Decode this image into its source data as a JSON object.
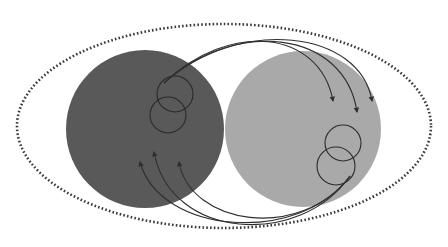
{
  "diagram": {
    "width": 448,
    "height": 247,
    "colors": {
      "background": "#ffffff",
      "boundary": "#3a3a3a",
      "left_region": "#595959",
      "right_region": "#a9a9a9",
      "lines": "#2f2f2f",
      "small_circles": "#2a2a2a"
    },
    "boundary_ellipse": {
      "cx": 224,
      "cy": 126,
      "rx": 207,
      "ry": 102,
      "style": "dotted"
    },
    "regions": [
      {
        "id": "left",
        "cx": 145,
        "cy": 129,
        "r": 79,
        "shade": "dark"
      },
      {
        "id": "right",
        "cx": 303,
        "cy": 129,
        "r": 78,
        "shade": "light"
      }
    ],
    "small_circles": [
      {
        "region": "left",
        "cx": 175,
        "cy": 94,
        "r": 18
      },
      {
        "region": "left",
        "cx": 168,
        "cy": 115,
        "r": 18
      },
      {
        "region": "right",
        "cx": 343,
        "cy": 143,
        "r": 18
      },
      {
        "region": "right",
        "cx": 336,
        "cy": 166,
        "r": 19
      }
    ],
    "arrows_top": [
      {
        "from": [
          164,
          83
        ],
        "c1": [
          230,
          20
        ],
        "c2": [
          320,
          30
        ],
        "to": [
          333,
          101
        ]
      },
      {
        "from": [
          164,
          83
        ],
        "c1": [
          235,
          18
        ],
        "c2": [
          345,
          30
        ],
        "to": [
          357,
          112
        ]
      },
      {
        "from": [
          164,
          83
        ],
        "c1": [
          240,
          16
        ],
        "c2": [
          360,
          30
        ],
        "to": [
          372,
          101
        ]
      }
    ],
    "arrows_bottom": [
      {
        "from": [
          350,
          176
        ],
        "c1": [
          300,
          245
        ],
        "c2": [
          160,
          235
        ],
        "to": [
          140,
          162
        ]
      },
      {
        "from": [
          350,
          176
        ],
        "c1": [
          300,
          248
        ],
        "c2": [
          170,
          240
        ],
        "to": [
          154,
          152
        ]
      },
      {
        "from": [
          350,
          176
        ],
        "c1": [
          300,
          242
        ],
        "c2": [
          190,
          225
        ],
        "to": [
          179,
          162
        ]
      }
    ]
  }
}
